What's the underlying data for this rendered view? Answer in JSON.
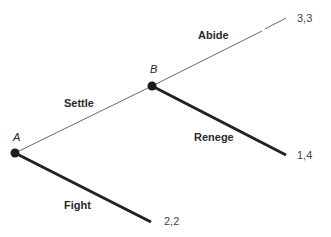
{
  "diagram": {
    "type": "game-tree",
    "nodes": [
      {
        "id": "A",
        "label": "A"
      },
      {
        "id": "B",
        "label": "B"
      }
    ],
    "branches": [
      {
        "from": "A",
        "to": "B",
        "label": "Settle"
      },
      {
        "from": "A",
        "to": "end1",
        "label": "Fight",
        "payoff": "2,2"
      },
      {
        "from": "B",
        "to": "end2",
        "label": "Abide",
        "payoff": "3,3"
      },
      {
        "from": "B",
        "to": "end3",
        "label": "Renege",
        "payoff": "1,4"
      }
    ]
  }
}
